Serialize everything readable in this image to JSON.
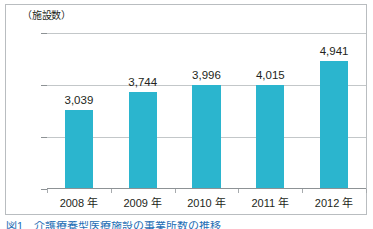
{
  "figure": {
    "axis_title": "（施設数）",
    "caption": "図1　介護療養型医療施設の事業所数の推移",
    "bar_color": "#2bb5ce",
    "text_color": "#231f20",
    "grid_color": "#c3c7c9",
    "axis_color": "#8d9295",
    "frame_color": "#b9bdc0",
    "background": "#ffffff"
  },
  "chart_data": {
    "type": "bar",
    "title": "",
    "subtitle": "",
    "xlabel": "",
    "ylabel": "（施設数）",
    "categories": [
      "2008 年",
      "2009 年",
      "2010 年",
      "2011 年",
      "2012 年"
    ],
    "values": [
      3039,
      3744,
      3996,
      4015,
      4941
    ],
    "data_labels": [
      "3,039",
      "3,744",
      "3,996",
      "4,015",
      "4,941"
    ],
    "ylim": [
      0,
      6000
    ],
    "yticks": [
      0,
      2000,
      4000,
      6000
    ],
    "ytick_labels": [
      "0",
      "2,000",
      "4,000",
      "6,000"
    ],
    "grid": "horizontal",
    "legend": "none",
    "orientation": "vertical",
    "series": [
      {
        "name": "施設数",
        "values": [
          3039,
          3744,
          3996,
          4015,
          4941
        ]
      }
    ]
  }
}
